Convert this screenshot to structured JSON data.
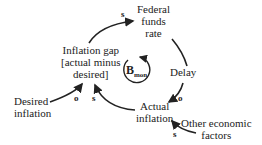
{
  "diagram": {
    "type": "causal loop diagram",
    "nodes": {
      "federal_funds_rate": [
        "Federal",
        "funds",
        "rate"
      ],
      "inflation_gap": [
        "Inflation gap",
        "[actual minus",
        "desired]"
      ],
      "delay": "Delay",
      "actual_inflation": [
        "Actual",
        "inflation"
      ],
      "desired_inflation": [
        "Desired",
        "inflation"
      ],
      "other_factors": [
        "Other economic",
        "factors"
      ]
    },
    "loop": {
      "letter": "B",
      "subscript": "mon"
    },
    "polarities": {
      "gap_to_rate": "s",
      "rate_to_actual": "o",
      "desired_to_gap": "o",
      "actual_to_gap": "s",
      "other_to_actual": "s"
    }
  }
}
